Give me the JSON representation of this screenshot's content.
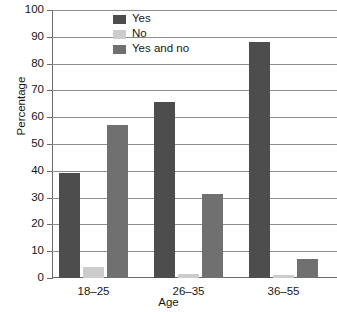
{
  "chart_data": {
    "type": "bar",
    "title": "",
    "xlabel": "Age",
    "ylabel": "Percentage",
    "categories": [
      "18–25",
      "26–35",
      "36–55"
    ],
    "series": [
      {
        "name": "Yes",
        "color": "#4d4d4d",
        "values": [
          39,
          65.5,
          88
        ]
      },
      {
        "name": "No",
        "color": "#cccccc",
        "values": [
          4,
          1.5,
          1
        ]
      },
      {
        "name": "Yes and no",
        "color": "#707070",
        "values": [
          57,
          31.5,
          7
        ]
      }
    ],
    "ylim": [
      0,
      100
    ],
    "yticks": [
      0,
      10,
      20,
      30,
      40,
      50,
      60,
      70,
      80,
      90,
      100
    ],
    "ytick_labels": [
      "0",
      "10",
      "20",
      "30",
      "40",
      "50",
      "60",
      "70",
      "80",
      "90",
      "100"
    ],
    "grid": true,
    "grid_axis": "y",
    "legend_position": "top-center",
    "background": "#ffffff"
  }
}
